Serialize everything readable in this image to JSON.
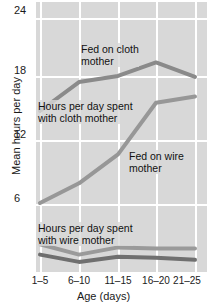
{
  "chart_data": {
    "type": "line",
    "title": "",
    "xlabel": "Age (days)",
    "ylabel": "Mean hours per day",
    "categories": [
      "1–5",
      "6–10",
      "11–15",
      "16–20",
      "21–25"
    ],
    "yticks": [
      6,
      12,
      18,
      24
    ],
    "ylim": [
      0,
      25.5
    ],
    "grid": true,
    "legend_position": "inline-annotations",
    "series": [
      {
        "name": "Fed on cloth mother",
        "color": "#8a8a8a",
        "values": [
          15.0,
          17.8,
          18.4,
          19.7,
          18.3
        ]
      },
      {
        "name": "Hours per day spent with cloth mother",
        "color": "#979797",
        "values": [
          6.1,
          8.0,
          10.8,
          15.8,
          16.4
        ]
      },
      {
        "name": "Hours per day spent with wire mother",
        "color": "#9a9a9a",
        "values": [
          2.1,
          1.1,
          1.8,
          1.7,
          1.7
        ]
      },
      {
        "name": "Fed on wire mother",
        "color": "#6f6f6f",
        "values": [
          1.1,
          0.4,
          0.9,
          0.8,
          0.6
        ]
      }
    ],
    "annotations": [
      {
        "text": "Fed on cloth\nmother",
        "x_px": 81,
        "y_px": 43
      },
      {
        "text": "Hours per day spent\nwith cloth mother",
        "x_px": 38,
        "y_px": 100
      },
      {
        "text": "Fed on wire\nmother",
        "x_px": 129,
        "y_px": 150
      },
      {
        "text": "Hours per day spent\nwith wire mother",
        "x_px": 38,
        "y_px": 222
      }
    ]
  },
  "axes": {
    "y_title": "Mean hours per day",
    "x_title": "Age (days)",
    "y_tick_labels": [
      "24",
      "18",
      "12",
      "6"
    ],
    "x_tick_labels": [
      "1–5",
      "6–10",
      "11–15",
      "16–20",
      "21–25"
    ]
  },
  "colors": {
    "plot_background": "#d8d8d8",
    "gridline": "#ffffff",
    "line_dark": "#6f6f6f",
    "line_mid": "#8a8a8a",
    "line_light": "#9a9a9a",
    "text": "#1a1a1a"
  }
}
